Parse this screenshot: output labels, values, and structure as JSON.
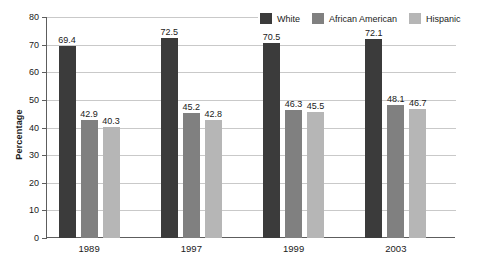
{
  "chart_data": {
    "type": "bar",
    "title": "",
    "subtitle": "",
    "xlabel": "",
    "ylabel": "Percentage",
    "ylim": [
      0,
      80
    ],
    "yticks": [
      0,
      10,
      20,
      30,
      40,
      50,
      60,
      70,
      80
    ],
    "ytick_labels": [
      "0",
      "10",
      "20",
      "30",
      "40",
      "50",
      "60",
      "70",
      "80"
    ],
    "grid": true,
    "legend_position": "top-right",
    "categories": [
      "1989",
      "1997",
      "1999",
      "2003"
    ],
    "series": [
      {
        "name": "White",
        "color": "#3b3b3b",
        "values": [
          69.4,
          72.5,
          70.5,
          72.1
        ],
        "labels": [
          "69.4",
          "72.5",
          "70.5",
          "72.1"
        ]
      },
      {
        "name": "African American",
        "color": "#808080",
        "values": [
          42.9,
          45.2,
          46.3,
          48.1
        ],
        "labels": [
          "42.9",
          "45.2",
          "46.3",
          "48.1"
        ]
      },
      {
        "name": "Hispanic",
        "color": "#b6b6b6",
        "values": [
          40.3,
          42.8,
          45.5,
          46.7
        ],
        "labels": [
          "40.3",
          "42.8",
          "45.5",
          "46.7"
        ]
      }
    ]
  },
  "axis": {
    "y_title": "Percentage"
  },
  "colors": {
    "series_white": "#3b3b3b",
    "series_african_american": "#808080",
    "series_hispanic": "#b6b6b6",
    "gridline": "#c9c9c9",
    "axis": "#5d5d5d",
    "text": "#1a1a1a",
    "background": "#ffffff"
  }
}
